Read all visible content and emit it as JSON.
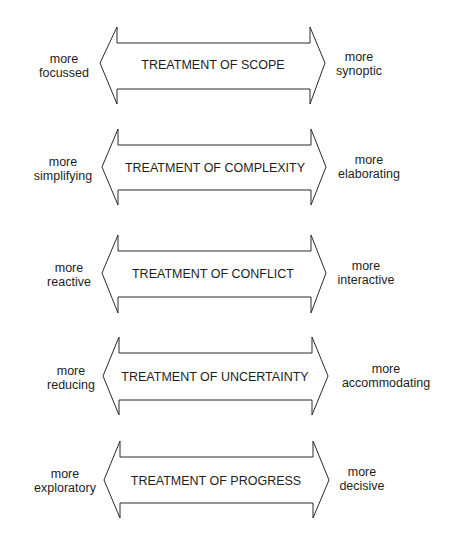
{
  "diagram": {
    "rows": [
      {
        "title": "TREATMENT OF SCOPE",
        "left_line1": "more",
        "left_line2": "focussed",
        "right_line1": "more",
        "right_line2": "synoptic"
      },
      {
        "title": "TREATMENT OF COMPLEXITY",
        "left_line1": "more",
        "left_line2": "simplifying",
        "right_line1": "more",
        "right_line2": "elaborating"
      },
      {
        "title": "TREATMENT OF CONFLICT",
        "left_line1": "more",
        "left_line2": "reactive",
        "right_line1": "more",
        "right_line2": "interactive"
      },
      {
        "title": "TREATMENT OF UNCERTAINTY",
        "left_line1": "more",
        "left_line2": "reducing",
        "right_line1": "more",
        "right_line2": "accommodating"
      },
      {
        "title": "TREATMENT OF PROGRESS",
        "left_line1": "more",
        "left_line2": "exploratory",
        "right_line1": "more",
        "right_line2": "decisive"
      }
    ]
  }
}
